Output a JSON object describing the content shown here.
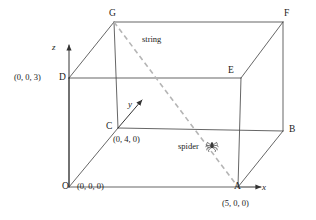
{
  "figure": {
    "background_color": "#ffffff",
    "line_color": "#4a4a4a",
    "string_color": "#b5b5b5",
    "text_color": "#1a1a1a",
    "width": 316,
    "height": 220
  },
  "axes": [
    {
      "name": "x",
      "label": "x",
      "x": 262,
      "y": 183
    },
    {
      "name": "y",
      "label": "y",
      "x": 128,
      "y": 100
    },
    {
      "name": "z",
      "label": "z",
      "x": 52,
      "y": 43
    }
  ],
  "vertices": [
    {
      "name": "O",
      "label": "O",
      "x": 62,
      "y": 182,
      "coord": "(0, 0, 0)",
      "coord_x": 77,
      "coord_y": 182
    },
    {
      "name": "A",
      "label": "A",
      "x": 234,
      "y": 182,
      "coord": "(5, 0, 0)",
      "coord_x": 222,
      "coord_y": 199
    },
    {
      "name": "B",
      "label": "B",
      "x": 289,
      "y": 125,
      "coord": "",
      "coord_x": 0,
      "coord_y": 0
    },
    {
      "name": "C",
      "label": "C",
      "x": 106,
      "y": 122,
      "coord": "(0, 4, 0)",
      "coord_x": 113,
      "coord_y": 135
    },
    {
      "name": "D",
      "label": "D",
      "x": 59,
      "y": 73,
      "coord": "(0, 0, 3)",
      "coord_x": 14,
      "coord_y": 73
    },
    {
      "name": "E",
      "label": "E",
      "x": 228,
      "y": 66,
      "coord": "",
      "coord_x": 0,
      "coord_y": 0
    },
    {
      "name": "F",
      "label": "F",
      "x": 284,
      "y": 9,
      "coord": "",
      "coord_x": 0,
      "coord_y": 0
    },
    {
      "name": "G",
      "label": "G",
      "x": 109,
      "y": 9,
      "coord": "",
      "coord_x": 0,
      "coord_y": 0
    }
  ],
  "annotations": [
    {
      "name": "string",
      "label": "string",
      "x": 142,
      "y": 35
    },
    {
      "name": "spider",
      "label": "spider",
      "x": 178,
      "y": 142
    }
  ],
  "geometry": {
    "note": "Cuboid 5 x 4 x 3 drawn in oblique projection; dashed string runs from top-back vertex G down to vertex A on the x-axis; a spider sits on the string.",
    "points": {
      "O": [
        69,
        187
      ],
      "A": [
        238,
        187
      ],
      "B": [
        283,
        131
      ],
      "C": [
        118,
        128
      ],
      "D": [
        69,
        78
      ],
      "E": [
        241,
        78
      ],
      "F": [
        283,
        22
      ],
      "G": [
        114,
        22
      ]
    },
    "string_from": "G",
    "string_to": "A",
    "spider_position": [
      212,
      146
    ]
  }
}
